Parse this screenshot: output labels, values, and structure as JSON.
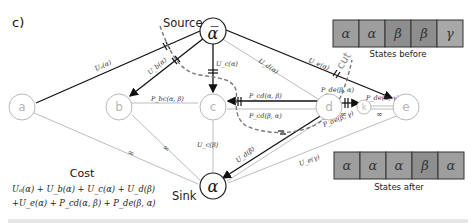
{
  "panel_label": "c)",
  "terminals": {
    "source": {
      "label": "Source",
      "symbol": "α̅"
    },
    "sink": {
      "label": "Sink",
      "symbol": "α"
    }
  },
  "nodes": {
    "a": "a",
    "b": "b",
    "c": "c",
    "d": "d",
    "k": "k",
    "e": "e"
  },
  "edges": {
    "src_a": "Uₐ(α)",
    "src_b": "U_b(α)",
    "src_c": "U_c(α)",
    "src_d": "U_d(α)",
    "src_e": "U_e(α)",
    "bc": "P_bc(α, β)",
    "cd_top": "P_cd(α, β)",
    "cd_bot": "P_cd(β, α)",
    "dk": "P_de(β, α)",
    "ke": "P_de(α, γ)",
    "d_e_low": "P_de(β, γ)",
    "c_sink": "U_c(β)",
    "d_sink": "U_d(β)",
    "e_sink": "U_e(γ)",
    "a_sink": "∞",
    "b_sink": "∞",
    "dk_inf": "∞",
    "ke_inf": "∞"
  },
  "cut": {
    "label": "cut"
  },
  "states_before": {
    "caption": "States before",
    "cells": [
      {
        "symbol": "α",
        "color": "#9e9e9e"
      },
      {
        "symbol": "α",
        "color": "#9e9e9e"
      },
      {
        "symbol": "β",
        "color": "#8e8e8e"
      },
      {
        "symbol": "β",
        "color": "#8e8e8e"
      },
      {
        "symbol": "γ",
        "color": "#a8a8a8"
      }
    ]
  },
  "states_after": {
    "caption": "States after",
    "cells": [
      {
        "symbol": "α",
        "color": "#9e9e9e"
      },
      {
        "symbol": "α",
        "color": "#9e9e9e"
      },
      {
        "symbol": "α",
        "color": "#9e9e9e"
      },
      {
        "symbol": "β",
        "color": "#8e8e8e"
      },
      {
        "symbol": "α",
        "color": "#9e9e9e"
      }
    ]
  },
  "cost": {
    "title": "Cost",
    "line1": "Uₐ(α) + U_b(α) + U_c(α) + U_d(β)",
    "line2": "+U_e(α) + P_cd(α, β) + P_de(β, α)"
  }
}
